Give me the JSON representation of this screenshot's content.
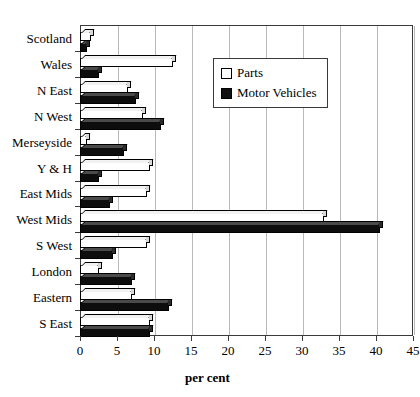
{
  "chart_data": {
    "type": "bar",
    "orientation": "horizontal",
    "title": "",
    "xlabel": "per cent",
    "ylabel": "",
    "xlim": [
      0,
      45
    ],
    "xticks": [
      0,
      5,
      10,
      15,
      20,
      25,
      30,
      35,
      40,
      45
    ],
    "grid": true,
    "legend_position": "top-right-inside",
    "categories": [
      "Scotland",
      "Wales",
      "N East",
      "N West",
      "Merseyside",
      "Y & H",
      "East Mids",
      "West Mids",
      "S West",
      "London",
      "Eastern",
      "S East"
    ],
    "series": [
      {
        "name": "Parts",
        "color": "#ffffff",
        "values": [
          1.5,
          12.5,
          6.5,
          8.5,
          1.0,
          9.5,
          9.0,
          33.0,
          9.0,
          2.5,
          7.0,
          9.5
        ]
      },
      {
        "name": "Motor Vehicles",
        "color": "#111111",
        "values": [
          1.0,
          2.5,
          7.5,
          11.0,
          6.0,
          2.5,
          4.0,
          40.5,
          4.5,
          7.0,
          12.0,
          9.5
        ]
      }
    ]
  },
  "legend": {
    "items": [
      {
        "label": "Parts",
        "swatch": "open-square-swatch"
      },
      {
        "label": "Motor Vehicles",
        "swatch": "filled-square-swatch"
      }
    ]
  },
  "axis": {
    "x_title": "per cent"
  }
}
